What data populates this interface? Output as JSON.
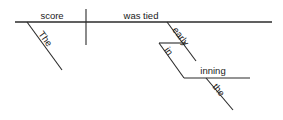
{
  "diagram": {
    "type": "reed-kellogg-sentence-diagram",
    "sentence": "The score was tied early in the inning.",
    "background_color": "#ffffff",
    "line_color": "#2b2b2b",
    "text_color": "#1a1a1a",
    "words": {
      "subject": "score",
      "subject_article": "The",
      "predicate": "was tied",
      "adverb": "early",
      "preposition": "in",
      "object_of_preposition": "inning",
      "object_article": "the"
    },
    "labels": {
      "subject": "score",
      "subject_article": "The",
      "predicate": "was tied",
      "adverb": "early",
      "preposition": "in",
      "object_of_preposition": "inning",
      "object_article": "the"
    }
  }
}
